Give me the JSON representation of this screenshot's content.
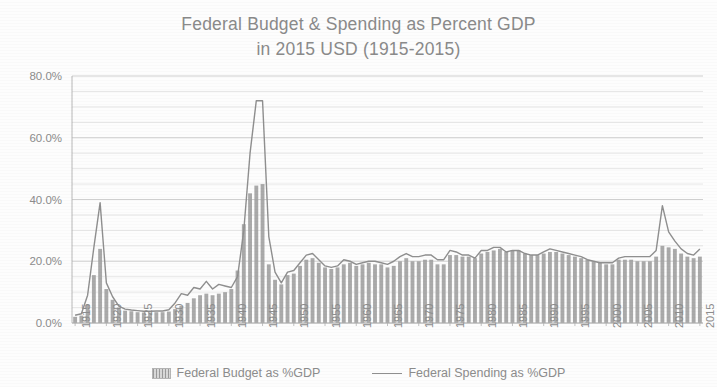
{
  "chart_data": {
    "type": "bar",
    "title": "Federal Budget & Spending as Percent GDP in 2015 USD (1915-2015)",
    "title_line1": "Federal Budget & Spending as Percent GDP",
    "title_line2": "in 2015 USD (1915-2015)",
    "xlabel": "",
    "ylabel": "",
    "ylim": [
      0,
      80
    ],
    "ytick_labels": [
      "0.0%",
      "20.0%",
      "40.0%",
      "60.0%",
      "80.0%"
    ],
    "ytick_values": [
      0,
      20,
      40,
      60,
      80
    ],
    "minor_gridline_step": 5,
    "grid": true,
    "legend_position": "bottom",
    "x": [
      1915,
      1916,
      1917,
      1918,
      1919,
      1920,
      1921,
      1922,
      1923,
      1924,
      1925,
      1926,
      1927,
      1928,
      1929,
      1930,
      1931,
      1932,
      1933,
      1934,
      1935,
      1936,
      1937,
      1938,
      1939,
      1940,
      1941,
      1942,
      1943,
      1944,
      1945,
      1946,
      1947,
      1948,
      1949,
      1950,
      1951,
      1952,
      1953,
      1954,
      1955,
      1956,
      1957,
      1958,
      1959,
      1960,
      1961,
      1962,
      1963,
      1964,
      1965,
      1966,
      1967,
      1968,
      1969,
      1970,
      1971,
      1972,
      1973,
      1974,
      1975,
      1976,
      1977,
      1978,
      1979,
      1980,
      1981,
      1982,
      1983,
      1984,
      1985,
      1986,
      1987,
      1988,
      1989,
      1990,
      1991,
      1992,
      1993,
      1994,
      1995,
      1996,
      1997,
      1998,
      1999,
      2000,
      2001,
      2002,
      2003,
      2004,
      2005,
      2006,
      2007,
      2008,
      2009,
      2010,
      2011,
      2012,
      2013,
      2014,
      2015
    ],
    "xtick_labels": [
      "1915",
      "1920",
      "1925",
      "1930",
      "1935",
      "1940",
      "1945",
      "1950",
      "1955",
      "1960",
      "1965",
      "1970",
      "1975",
      "1980",
      "1985",
      "1990",
      "1995",
      "2000",
      "2005",
      "2010",
      "2015"
    ],
    "xtick_years": [
      1915,
      1920,
      1925,
      1930,
      1935,
      1940,
      1945,
      1950,
      1955,
      1960,
      1965,
      1970,
      1975,
      1980,
      1985,
      1990,
      1995,
      2000,
      2005,
      2010,
      2015
    ],
    "series": [
      {
        "name": "Federal Budget as %GDP",
        "type": "bar",
        "color": "#9e9e9e",
        "values": [
          2.0,
          2.4,
          6.0,
          15.5,
          24.0,
          11.0,
          7.5,
          5.0,
          4.0,
          3.8,
          3.5,
          3.4,
          3.4,
          3.5,
          3.5,
          3.7,
          4.5,
          5.5,
          6.5,
          8.0,
          9.0,
          9.5,
          9.0,
          9.5,
          10.0,
          11.0,
          17.0,
          32.0,
          42.0,
          44.5,
          45.0,
          19.0,
          14.0,
          12.5,
          15.5,
          16.0,
          18.5,
          20.5,
          21.0,
          19.5,
          18.0,
          17.5,
          18.0,
          19.0,
          19.5,
          18.5,
          19.0,
          19.5,
          19.0,
          19.0,
          18.0,
          18.5,
          20.0,
          21.0,
          20.0,
          20.0,
          20.5,
          20.5,
          19.0,
          19.0,
          22.0,
          22.0,
          21.5,
          21.5,
          21.0,
          22.5,
          23.0,
          23.5,
          24.0,
          23.0,
          23.5,
          23.5,
          22.5,
          22.0,
          22.0,
          22.5,
          23.0,
          23.0,
          22.5,
          22.0,
          21.5,
          21.0,
          20.5,
          20.0,
          19.5,
          19.0,
          19.0,
          20.5,
          20.5,
          20.5,
          20.0,
          20.0,
          20.0,
          21.5,
          25.0,
          24.5,
          24.0,
          22.5,
          21.5,
          21.0,
          21.5
        ]
      },
      {
        "name": "Federal Spending as %GDP",
        "type": "line",
        "color": "#8f8f8f",
        "values": [
          2.5,
          3.0,
          9.0,
          24.5,
          39.0,
          13.0,
          8.5,
          5.5,
          4.5,
          4.2,
          4.0,
          3.8,
          3.8,
          3.9,
          3.9,
          4.3,
          6.5,
          9.5,
          9.0,
          11.5,
          11.0,
          13.5,
          11.0,
          12.5,
          12.0,
          11.5,
          15.0,
          30.0,
          55.0,
          72.0,
          72.0,
          28.0,
          16.5,
          13.0,
          16.5,
          17.0,
          19.5,
          22.0,
          22.5,
          20.5,
          18.5,
          18.0,
          18.5,
          20.5,
          20.0,
          19.0,
          19.5,
          20.0,
          20.0,
          19.5,
          19.0,
          20.0,
          21.5,
          22.5,
          21.5,
          21.5,
          22.0,
          22.0,
          20.5,
          20.5,
          23.5,
          23.0,
          22.0,
          22.0,
          21.0,
          23.5,
          23.5,
          24.5,
          24.5,
          23.0,
          23.5,
          23.5,
          22.5,
          22.0,
          22.0,
          23.0,
          24.0,
          23.5,
          23.0,
          22.5,
          22.0,
          21.5,
          20.5,
          20.0,
          19.5,
          19.5,
          19.5,
          21.0,
          21.5,
          21.5,
          21.5,
          21.5,
          21.5,
          23.5,
          38.0,
          29.5,
          26.5,
          24.0,
          22.5,
          22.0,
          24.0
        ]
      }
    ]
  },
  "legend": {
    "items": [
      {
        "label": "Federal Budget as %GDP",
        "marker": "bar-swatch"
      },
      {
        "label": "Federal Spending as %GDP",
        "marker": "line-swatch"
      }
    ]
  }
}
